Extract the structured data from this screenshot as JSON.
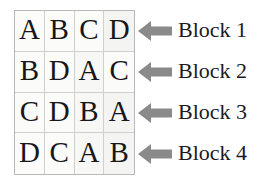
{
  "figure": {
    "name": "latin-square-block-diagram",
    "colors": {
      "letter": "#17171a",
      "grid_line": "#cfcfcf",
      "grid_border": "#b9b9b9",
      "cell_background": "#fbfbfa",
      "arrow": "#8a8a8a",
      "label_text": "#1b1b1f",
      "page_background": "#ffffff"
    },
    "grid": {
      "rows": 4,
      "columns": 4,
      "cells": [
        [
          "A",
          "B",
          "C",
          "D"
        ],
        [
          "B",
          "D",
          "A",
          "C"
        ],
        [
          "C",
          "D",
          "B",
          "A"
        ],
        [
          "D",
          "C",
          "A",
          "B"
        ]
      ]
    },
    "annotations": [
      {
        "arrow_icon": "arrow-left-icon",
        "label": "Block 1"
      },
      {
        "arrow_icon": "arrow-left-icon",
        "label": "Block 2"
      },
      {
        "arrow_icon": "arrow-left-icon",
        "label": "Block 3"
      },
      {
        "arrow_icon": "arrow-left-icon",
        "label": "Block 4"
      }
    ]
  }
}
